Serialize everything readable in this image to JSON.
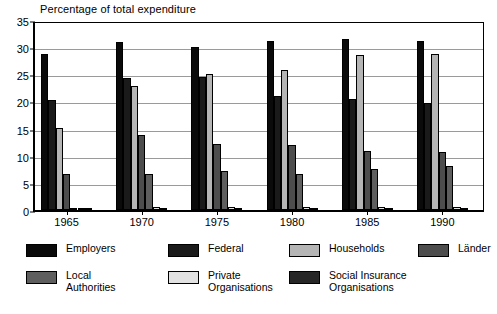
{
  "chart_data": {
    "type": "bar",
    "title": "Percentage of total expenditure",
    "xlabel": "",
    "ylabel": "",
    "ylim": [
      0,
      35
    ],
    "yticks": [
      0,
      5,
      10,
      15,
      20,
      25,
      30,
      35
    ],
    "grid": true,
    "legend_position": "bottom",
    "categories": [
      "1965",
      "1970",
      "1975",
      "1980",
      "1985",
      "1990"
    ],
    "series": [
      {
        "name": "Employers",
        "color": "#0a0a0a",
        "values": [
          28.7,
          31.0,
          30.1,
          31.1,
          31.5,
          31.1
        ]
      },
      {
        "name": "Federal",
        "color": "#1a1a1a",
        "values": [
          20.2,
          24.3,
          24.5,
          21.0,
          20.5,
          19.7
        ]
      },
      {
        "name": "Households",
        "color": "#b5b5b5",
        "values": [
          15.1,
          22.9,
          25.0,
          25.8,
          28.5,
          28.8
        ]
      },
      {
        "name": "Länder",
        "color": "#4d4d4d",
        "values": [
          6.7,
          13.8,
          12.2,
          11.9,
          10.8,
          10.6
        ]
      },
      {
        "name": "Local Authorities",
        "color": "#5e5e5e",
        "values": [
          0.4,
          6.6,
          7.2,
          6.6,
          7.6,
          8.2
        ]
      },
      {
        "name": "Private Organisations",
        "color": "#e2e2e2",
        "values": [
          0.35,
          0.5,
          0.5,
          0.5,
          0.5,
          0.5
        ]
      },
      {
        "name": "Social Insurance Organisations",
        "color": "#262626",
        "values": [
          0.3,
          0.4,
          0.4,
          0.4,
          0.4,
          0.4
        ]
      }
    ]
  },
  "legend": {
    "items": [
      {
        "label": "Employers"
      },
      {
        "label": "Federal"
      },
      {
        "label": "Households"
      },
      {
        "label": "Länder"
      },
      {
        "label": "Local\nAuthorities"
      },
      {
        "label": "Private\nOrganisations"
      },
      {
        "label": "Social Insurance\nOrganisations"
      }
    ]
  }
}
